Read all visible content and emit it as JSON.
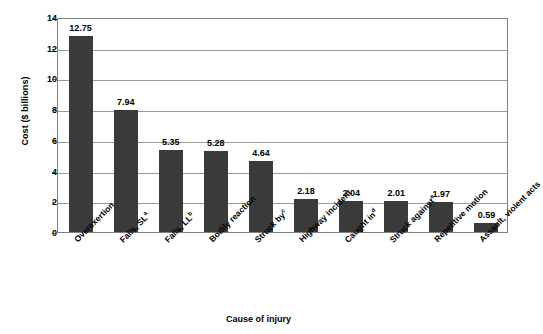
{
  "chart_data": {
    "type": "bar",
    "title": "",
    "xlabel": "Cause of injury",
    "ylabel": "Cost ($ billions)",
    "ylim": [
      0,
      14
    ],
    "ytick_step": 2,
    "yticks": [
      "0",
      "2",
      "4",
      "6",
      "8",
      "10",
      "12",
      "14"
    ],
    "grid": true,
    "legend": "none",
    "bar_color": "#3a3a3a",
    "gridline_color": "#9a9a9a",
    "plot_border_color": "#808080",
    "categories": [
      "Overexertion",
      "Falls, SL",
      "Falls, LL",
      "Bodily reaction",
      "Struck by",
      "Highway incident",
      "Caught in",
      "Struck against",
      "Repetitive motion",
      "Assault, violent acts"
    ],
    "category_superscripts": [
      "",
      "a",
      "b",
      "",
      "c",
      "",
      "d",
      "e",
      "",
      ""
    ],
    "values": [
      12.75,
      7.94,
      5.35,
      5.28,
      4.64,
      2.18,
      2.04,
      2.01,
      1.97,
      0.59
    ],
    "value_labels": [
      "12.75",
      "7.94",
      "5.35",
      "5.28",
      "4.64",
      "2.18",
      "2.04",
      "2.01",
      "1.97",
      "0.59"
    ]
  }
}
